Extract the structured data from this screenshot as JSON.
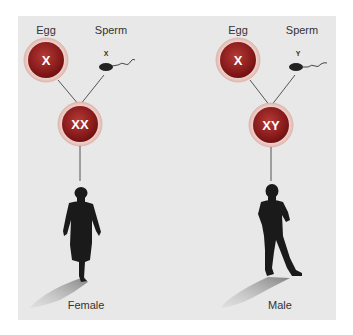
{
  "diagram": {
    "colors": {
      "panel": "#e8e8e8",
      "cell_fill": "#8a1c1c",
      "cell_halo": "#f4d9d4",
      "silhouette": "#1a1a1a",
      "line": "#444444"
    },
    "female": {
      "egg_label": "Egg",
      "sperm_label": "Sperm",
      "egg_chromosome": "X",
      "sperm_chromosome": "X",
      "zygote": "XX",
      "result_label": "Female"
    },
    "male": {
      "egg_label": "Egg",
      "sperm_label": "Sperm",
      "egg_chromosome": "X",
      "sperm_chromosome": "Y",
      "zygote": "XY",
      "result_label": "Male"
    }
  }
}
